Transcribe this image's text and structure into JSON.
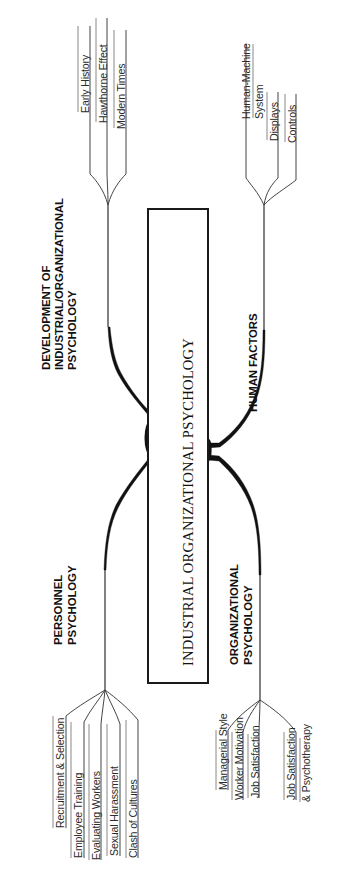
{
  "diagram": {
    "type": "mind-map",
    "orientation": "rotated-90",
    "center": {
      "title": "INDUSTRIAL ORGANIZATIONAL PSYCHOLOGY"
    },
    "branches": [
      {
        "id": "development",
        "label_lines": [
          "DEVELOPMENT OF",
          "INDUSTRIAL/ORGANIZATIONAL",
          "PSYCHOLOGY"
        ],
        "label_full": "DEVELOPMENT OF INDUSTRIAL/ORGANIZATIONAL PSYCHOLOGY",
        "children": [
          {
            "label_lines": [
              "Early History"
            ],
            "label_full": "Early History"
          },
          {
            "label_lines": [
              "Hawthorne Effect"
            ],
            "label_full": "Hawthorne Effect"
          },
          {
            "label_lines": [
              "Modern Times"
            ],
            "label_full": "Modern Times"
          }
        ]
      },
      {
        "id": "human-factors",
        "label_lines": [
          "HUMAN FACTORS"
        ],
        "label_full": "HUMAN FACTORS",
        "children": [
          {
            "label_lines": [
              "Human-Machine",
              "System"
            ],
            "label_full": "Human-Machine System"
          },
          {
            "label_lines": [
              "Displays"
            ],
            "label_full": "Displays"
          },
          {
            "label_lines": [
              "Controls"
            ],
            "label_full": "Controls"
          }
        ]
      },
      {
        "id": "personnel",
        "label_lines": [
          "PERSONNEL",
          "PSYCHOLOGY"
        ],
        "label_full": "PERSONNEL PSYCHOLOGY",
        "children": [
          {
            "label_lines": [
              "Recruitment & Selection"
            ],
            "label_full": "Recruitment & Selection"
          },
          {
            "label_lines": [
              "Employee Training"
            ],
            "label_full": "Employee Training"
          },
          {
            "label_lines": [
              "Evaluating Workers"
            ],
            "label_full": "Evaluating Workers"
          },
          {
            "label_lines": [
              "Sexual Harassment"
            ],
            "label_full": "Sexual Harassment"
          },
          {
            "label_lines": [
              "Clash of Cultures"
            ],
            "label_full": "Clash of Cultures"
          }
        ]
      },
      {
        "id": "organizational",
        "label_lines": [
          "ORGANIZATIONAL",
          "PSYCHOLOGY"
        ],
        "label_full": "ORGANIZATIONAL PSYCHOLOGY",
        "children": [
          {
            "label_lines": [
              "Managerial Style"
            ],
            "label_full": "Managerial Style"
          },
          {
            "label_lines": [
              "Worker Motivation"
            ],
            "label_full": "Worker Motivation"
          },
          {
            "label_lines": [
              "Job Satisfaction"
            ],
            "label_full": "Job Satisfaction"
          },
          {
            "label_lines": [
              "Job Satisfaction",
              "& Psychotherapy"
            ],
            "label_full": "Job Satisfaction & Psychotherapy"
          }
        ]
      }
    ],
    "colors": {
      "stroke": "#1a1a1a",
      "branch_fill": "#111111",
      "text": "#1a1a1a",
      "background": "#ffffff",
      "subline": "#555555"
    }
  }
}
